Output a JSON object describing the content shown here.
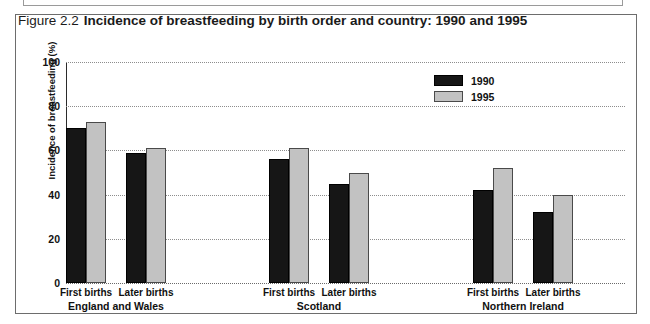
{
  "figure": {
    "number": "Figure 2.2",
    "title": "Incidence of breastfeeding by birth order and country: 1990 and 1995"
  },
  "legend": {
    "position": "top-right",
    "items": [
      {
        "label": "1990",
        "color": "#161616"
      },
      {
        "label": "1995",
        "color": "#c2c2c2"
      }
    ]
  },
  "axis": {
    "y_title": "Incidence of breastfeeding (%)",
    "y_ticks": [
      "100",
      "80",
      "60",
      "40",
      "20",
      "0"
    ]
  },
  "groups": [
    {
      "name": "England and Wales",
      "categories": [
        "First births",
        "Later births"
      ]
    },
    {
      "name": "Scotland",
      "categories": [
        "First births",
        "Later births"
      ]
    },
    {
      "name": "Northern Ireland",
      "categories": [
        "First births",
        "Later births"
      ]
    }
  ],
  "chart_data": {
    "type": "bar",
    "title": "Incidence of breastfeeding by birth order and country: 1990 and 1995",
    "xlabel": "",
    "ylabel": "Incidence of breastfeeding (%)",
    "ylim": [
      0,
      100
    ],
    "yticks": [
      0,
      20,
      40,
      60,
      80,
      100
    ],
    "grid": true,
    "legend_position": "top-right",
    "categories": [
      "England and Wales - First births",
      "England and Wales - Later births",
      "Scotland - First births",
      "Scotland - Later births",
      "Northern Ireland - First births",
      "Northern Ireland - Later births"
    ],
    "series": [
      {
        "name": "1990",
        "color": "#161616",
        "values": [
          70,
          59,
          56,
          45,
          42,
          32
        ]
      },
      {
        "name": "1995",
        "color": "#c2c2c2",
        "values": [
          73,
          61,
          61,
          50,
          52,
          40
        ]
      }
    ]
  }
}
